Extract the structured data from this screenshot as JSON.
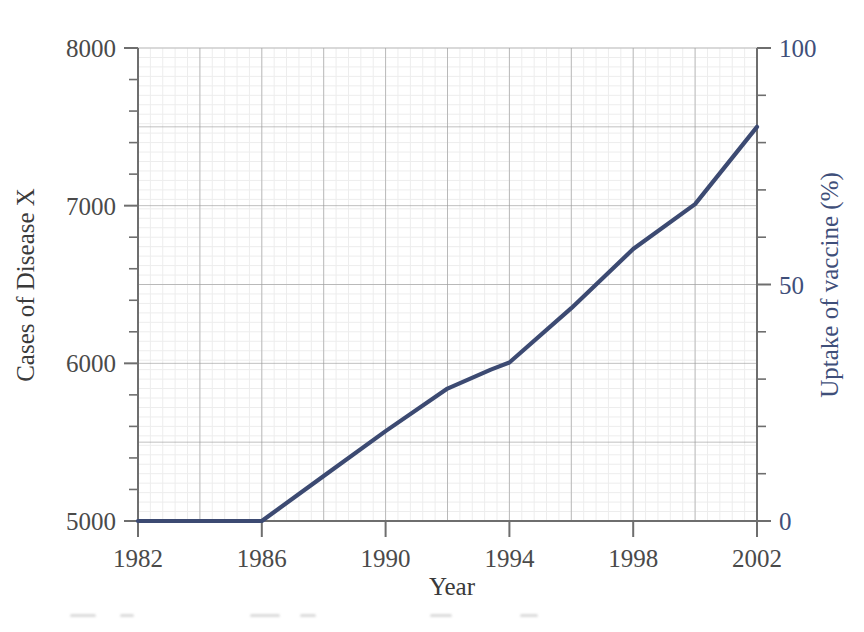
{
  "chart_data": {
    "type": "line",
    "title": "",
    "xlabel": "Year",
    "ylabel": "Cases of Disease X",
    "ylabel_right": "Uptake of vaccine (%)",
    "xlim": [
      1982,
      2002
    ],
    "ylim": [
      5000,
      8000
    ],
    "ylim_right": [
      0,
      100
    ],
    "grid": true,
    "legend": "none",
    "x_ticks": [
      1982,
      1986,
      1990,
      1994,
      1998,
      2002
    ],
    "x_tick_labels": [
      "1982",
      "1986",
      "1990",
      "1994",
      "1998",
      "2002"
    ],
    "y_ticks": [
      5000,
      6000,
      7000,
      8000
    ],
    "y_tick_labels": [
      "5000",
      "6000",
      "7000",
      "8000"
    ],
    "y_minor_step": 200,
    "y_right_ticks": [
      0,
      50,
      100
    ],
    "y_right_tick_labels": [
      "0",
      "50",
      "100"
    ],
    "y_right_minor_step": 10,
    "series": [
      {
        "name": "Uptake of vaccine",
        "color": "#3c4a72",
        "axis": "right",
        "x": [
          1982,
          1983,
          1984,
          1985,
          1986,
          1988,
          1990,
          1992,
          1993.4,
          1994,
          1996,
          1998,
          2000,
          2002
        ],
        "values_right": [
          0,
          0,
          0,
          0,
          0,
          9.5,
          19,
          28,
          32,
          33.5,
          45,
          57.5,
          67,
          75
        ],
        "values_left": [
          5000,
          5000,
          5000,
          5000,
          5000,
          5285,
          5570,
          5840,
          5960,
          6005,
          6350,
          6725,
          7010,
          7500
        ]
      }
    ],
    "annotations": []
  },
  "axis": {
    "left_title": "Cases of Disease X",
    "right_title": "Uptake of vaccine (%)",
    "bottom_title": "Year"
  },
  "colors": {
    "line": "#3c4a72",
    "left_text": "#4a4a4a",
    "right_text": "#3f4f7a",
    "major_grid": "#9a9a9a",
    "minor_grid": "#ededed",
    "axis": "#6e6e6e",
    "background": "#ffffff"
  }
}
